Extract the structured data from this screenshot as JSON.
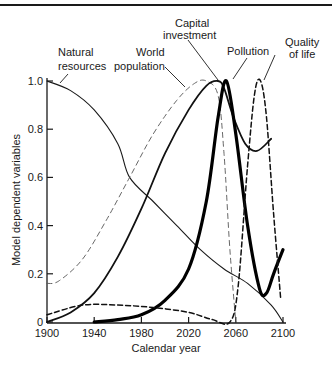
{
  "chart_data": {
    "type": "line",
    "title": "",
    "xlabel": "Calendar year",
    "ylabel": "Model dependent variables",
    "xlim": [
      1900,
      2100
    ],
    "ylim": [
      0,
      1.0
    ],
    "xticks": [
      1900,
      1940,
      1980,
      2020,
      2060,
      2100
    ],
    "yticks": [
      0,
      0.2,
      0.4,
      0.6,
      0.8,
      1.0
    ],
    "ytick_labels": [
      "0",
      "0.2",
      "0.4",
      "0.6",
      "0.8",
      "1.0"
    ],
    "grid": false,
    "legend": "callout labels above plot",
    "series": [
      {
        "name": "Natural resources",
        "style": "solid-thin",
        "x": [
          1900,
          1920,
          1940,
          1960,
          1970,
          1990,
          2010,
          2030,
          2050,
          2070,
          2090,
          2100
        ],
        "values": [
          1.0,
          0.96,
          0.88,
          0.74,
          0.6,
          0.5,
          0.4,
          0.3,
          0.22,
          0.16,
          0.07,
          0.0
        ]
      },
      {
        "name": "World population",
        "style": "dashed-light",
        "x": [
          1900,
          1910,
          1930,
          1950,
          1970,
          1990,
          2010,
          2025,
          2035,
          2045,
          2050,
          2055,
          2060
        ],
        "values": [
          0.16,
          0.17,
          0.26,
          0.42,
          0.6,
          0.78,
          0.92,
          0.99,
          1.0,
          0.94,
          0.7,
          0.3,
          0.0
        ]
      },
      {
        "name": "Capital investment",
        "style": "solid-medium",
        "x": [
          1900,
          1920,
          1940,
          1960,
          1980,
          2000,
          2020,
          2035,
          2045,
          2050,
          2058,
          2068,
          2078,
          2090
        ],
        "values": [
          0.0,
          0.04,
          0.12,
          0.27,
          0.47,
          0.7,
          0.88,
          0.98,
          1.0,
          0.97,
          0.85,
          0.74,
          0.71,
          0.76
        ]
      },
      {
        "name": "Pollution",
        "style": "solid-thick",
        "x": [
          1940,
          1960,
          1980,
          2000,
          2020,
          2035,
          2045,
          2052,
          2060,
          2070,
          2080,
          2086,
          2092,
          2100
        ],
        "values": [
          0.0,
          0.01,
          0.03,
          0.09,
          0.22,
          0.5,
          0.85,
          1.0,
          0.78,
          0.4,
          0.14,
          0.12,
          0.2,
          0.3
        ]
      },
      {
        "name": "Quality of life",
        "style": "dashed-dark",
        "x": [
          1900,
          1930,
          1960,
          1990,
          2020,
          2040,
          2055,
          2062,
          2070,
          2076,
          2081,
          2086,
          2092,
          2098
        ],
        "values": [
          0.03,
          0.07,
          0.07,
          0.06,
          0.04,
          0.01,
          0.0,
          0.15,
          0.65,
          0.95,
          1.0,
          0.85,
          0.45,
          0.1
        ]
      }
    ],
    "annotations": [
      {
        "text": "Natural\nresources",
        "series": "Natural resources"
      },
      {
        "text": "World\npopulation",
        "series": "World population"
      },
      {
        "text": "Capital\ninvestment",
        "series": "Capital investment"
      },
      {
        "text": "Pollution",
        "series": "Pollution"
      },
      {
        "text": "Quality\nof life",
        "series": "Quality of life"
      }
    ]
  },
  "labels": {
    "natural_resources_1": "Natural",
    "natural_resources_2": "resources",
    "world_population_1": "World",
    "world_population_2": "population",
    "capital_investment_1": "Capital",
    "capital_investment_2": "investment",
    "pollution": "Pollution",
    "quality_of_life_1": "Quality",
    "quality_of_life_2": "of life",
    "xlabel": "Calendar year",
    "ylabel": "Model dependent variables"
  }
}
